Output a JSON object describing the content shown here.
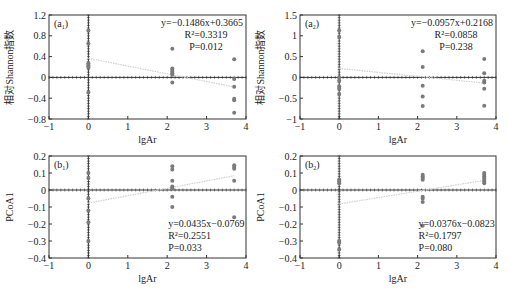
{
  "chart_data": [
    {
      "id": "a1",
      "type": "scatter",
      "panel_label": "(a",
      "panel_sub": "1",
      "xlabel": "lgAr",
      "ylabel": "相对Shannon指数",
      "xlim": [
        -1,
        4
      ],
      "ylim": [
        -0.8,
        1.2
      ],
      "xticks": [
        -1,
        0,
        1,
        2,
        3,
        4
      ],
      "xtick_labels": [
        "−1",
        "0",
        "1",
        "2",
        "3",
        "4"
      ],
      "yticks": [
        -0.8,
        -0.4,
        0,
        0.4,
        0.8,
        1.2
      ],
      "ytick_labels": [
        "−0.8",
        "−0.4",
        "0",
        "0.4",
        "0.8",
        "1.2"
      ],
      "points": [
        [
          0,
          0.9
        ],
        [
          0,
          0.65
        ],
        [
          0,
          0.27
        ],
        [
          0,
          0.24
        ],
        [
          0,
          0.22
        ],
        [
          0,
          0.19
        ],
        [
          0,
          -0.29
        ],
        [
          2.13,
          0.55
        ],
        [
          2.13,
          0.17
        ],
        [
          2.13,
          0.14
        ],
        [
          2.13,
          0.11
        ],
        [
          2.13,
          0.08
        ],
        [
          2.13,
          0.05
        ],
        [
          2.13,
          -0.1
        ],
        [
          3.7,
          0.35
        ],
        [
          3.7,
          -0.03
        ],
        [
          3.7,
          -0.18
        ],
        [
          3.7,
          -0.41
        ],
        [
          3.7,
          -0.44
        ],
        [
          3.7,
          -0.68
        ]
      ],
      "fit": {
        "slope": -0.1486,
        "intercept": 0.3665,
        "x_range": [
          0,
          3.7
        ]
      },
      "annotation": {
        "eq": "y=−0.1486x+0.3665",
        "r2": "R²=0.3319",
        "p": "P=0.012",
        "position": "top-right"
      }
    },
    {
      "id": "a2",
      "type": "scatter",
      "panel_label": "(a",
      "panel_sub": "2",
      "xlabel": "lgAr",
      "ylabel": "相对Shannon指数",
      "xlim": [
        -1,
        4
      ],
      "ylim": [
        -1,
        1.5
      ],
      "xticks": [
        -1,
        0,
        1,
        2,
        3,
        4
      ],
      "xtick_labels": [
        "−1",
        "0",
        "1",
        "2",
        "3",
        "4"
      ],
      "yticks": [
        -1,
        -0.5,
        0,
        0.5,
        1,
        1.5
      ],
      "ytick_labels": [
        "−1",
        "−0.5",
        "0",
        "0.5",
        "1",
        "1.5"
      ],
      "points": [
        [
          0,
          1.13
        ],
        [
          0,
          0.97
        ],
        [
          0,
          0.0
        ],
        [
          0,
          -0.08
        ],
        [
          0,
          -0.22
        ],
        [
          0,
          -0.27
        ],
        [
          0,
          -0.4
        ],
        [
          2.13,
          0.63
        ],
        [
          2.13,
          0.25
        ],
        [
          2.13,
          -0.2
        ],
        [
          2.13,
          -0.46
        ],
        [
          2.13,
          -0.69
        ],
        [
          3.7,
          0.44
        ],
        [
          3.7,
          0.1
        ],
        [
          3.7,
          -0.08
        ],
        [
          3.7,
          -0.12
        ],
        [
          3.7,
          -0.27
        ],
        [
          3.7,
          -0.68
        ]
      ],
      "fit": {
        "slope": -0.0957,
        "intercept": 0.2168,
        "x_range": [
          0,
          3.7
        ]
      },
      "annotation": {
        "eq": "y=−0.0957x+0.2168",
        "r2": "R²=0.0858",
        "p": "P=0.238",
        "position": "top-right"
      }
    },
    {
      "id": "b1",
      "type": "scatter",
      "panel_label": "(b",
      "panel_sub": "1",
      "xlabel": "lgAr",
      "ylabel": "PCoA1",
      "xlim": [
        -1,
        4
      ],
      "ylim": [
        -0.4,
        0.2
      ],
      "xticks": [
        -1,
        0,
        1,
        2,
        3,
        4
      ],
      "xtick_labels": [
        "−1",
        "0",
        "1",
        "2",
        "3",
        "4"
      ],
      "yticks": [
        -0.4,
        -0.3,
        -0.2,
        -0.1,
        0,
        0.1,
        0.2
      ],
      "ytick_labels": [
        "−0.4",
        "−0.3",
        "−0.2",
        "−0.1",
        "0",
        "0.1",
        "0.2"
      ],
      "points": [
        [
          0,
          0.1
        ],
        [
          0,
          0.07
        ],
        [
          0,
          -0.05
        ],
        [
          0,
          -0.12
        ],
        [
          0,
          -0.19
        ],
        [
          0,
          -0.3
        ],
        [
          2.13,
          0.14
        ],
        [
          2.13,
          0.12
        ],
        [
          2.13,
          0.055
        ],
        [
          2.13,
          0.02
        ],
        [
          2.13,
          0.01
        ],
        [
          2.13,
          -0.04
        ],
        [
          2.13,
          -0.1
        ],
        [
          3.7,
          0.145
        ],
        [
          3.7,
          0.135
        ],
        [
          3.7,
          0.125
        ],
        [
          3.7,
          0.055
        ],
        [
          3.7,
          -0.16
        ]
      ],
      "fit": {
        "slope": 0.0435,
        "intercept": -0.0769,
        "x_range": [
          0,
          3.7
        ]
      },
      "annotation": {
        "eq": "y=0.0435x−0.0769",
        "r2": "R²=0.2551",
        "p": "P=0.033",
        "position": "bottom-right"
      }
    },
    {
      "id": "b2",
      "type": "scatter",
      "panel_label": "(b",
      "panel_sub": "2",
      "xlabel": "lgAr",
      "ylabel": "PCoA1",
      "xlim": [
        -1,
        4
      ],
      "ylim": [
        -0.4,
        0.2
      ],
      "xticks": [
        -1,
        0,
        1,
        2,
        3,
        4
      ],
      "xtick_labels": [
        "−1",
        "0",
        "1",
        "2",
        "3",
        "4"
      ],
      "yticks": [
        -0.4,
        -0.3,
        -0.2,
        -0.1,
        0,
        0.1,
        0.2
      ],
      "ytick_labels": [
        "−0.4",
        "−0.3",
        "−0.2",
        "−0.1",
        "0",
        "0.1",
        "0.2"
      ],
      "points": [
        [
          0,
          0.06
        ],
        [
          0,
          0.05
        ],
        [
          0,
          0.04
        ],
        [
          0,
          -0.3
        ],
        [
          0,
          -0.31
        ],
        [
          0,
          -0.35
        ],
        [
          2.13,
          0.09
        ],
        [
          2.13,
          0.08
        ],
        [
          2.13,
          0.07
        ],
        [
          2.13,
          0.06
        ],
        [
          2.13,
          -0.04
        ],
        [
          2.13,
          -0.05
        ],
        [
          2.13,
          -0.07
        ],
        [
          2.13,
          -0.21
        ],
        [
          3.7,
          0.1
        ],
        [
          3.7,
          0.09
        ],
        [
          3.7,
          0.08
        ],
        [
          3.7,
          0.07
        ],
        [
          3.7,
          0.06
        ],
        [
          3.7,
          0.05
        ],
        [
          3.7,
          0.04
        ]
      ],
      "fit": {
        "slope": 0.0376,
        "intercept": -0.0823,
        "x_range": [
          0,
          3.7
        ]
      },
      "annotation": {
        "eq": "y=0.0376x−0.0823",
        "r2": "R²=0.1797",
        "p": "P=0.080",
        "position": "bottom-right"
      }
    }
  ],
  "style": {
    "point_color": "#7a7a7a",
    "fit_color": "#cfcfcf",
    "axis_color": "#333333",
    "text_color": "#222222"
  }
}
